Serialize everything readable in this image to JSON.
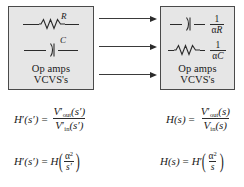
{
  "diagram": {
    "left_box": {
      "name": "original-network",
      "rows": [
        {
          "symbol": "resistor-icon",
          "label": "R"
        },
        {
          "symbol": "capacitor-icon",
          "label": "C"
        }
      ],
      "caption_line1": "Op amps",
      "caption_line2": "VCVS's"
    },
    "right_box": {
      "name": "transformed-network",
      "rows": [
        {
          "symbol": "capacitor-icon",
          "numerator": "1",
          "denominator_alpha": "α",
          "denominator_var": "R"
        },
        {
          "symbol": "resistor-icon",
          "numerator": "1",
          "denominator_alpha": "α",
          "denominator_var": "C"
        }
      ],
      "caption_line1": "Op amps",
      "caption_line2": "VCVS's"
    },
    "arrows": [
      {
        "name": "arrow-row-1",
        "direction": "right"
      },
      {
        "name": "arrow-row-2",
        "direction": "right"
      },
      {
        "name": "arrow-row-3",
        "direction": "right"
      }
    ],
    "equations": {
      "left_1": {
        "lhs_fn": "H",
        "lhs_prime": "′",
        "lhs_arg": "(s′)",
        "eq": "=",
        "num_fn": "V",
        "num_prime": "′",
        "num_sub": "out",
        "num_arg": "(s′)",
        "den_fn": "V",
        "den_prime": "′",
        "den_sub": "in",
        "den_arg": "(s′)"
      },
      "right_1": {
        "lhs_fn": "H",
        "lhs_arg": "(s)",
        "eq": "=",
        "num_fn": "V",
        "num_prime": "′",
        "num_sub": "out",
        "num_arg": "(s)",
        "den_fn": "V",
        "den_sub": "in",
        "den_arg": "(s)"
      },
      "left_2": {
        "lhs_fn": "H",
        "lhs_prime": "′",
        "lhs_arg": "(s′)",
        "eq": "=",
        "rhs_fn": "H",
        "num_alpha": "α",
        "num_exp": "2",
        "den_var": "s′"
      },
      "right_2": {
        "lhs_fn": "H",
        "lhs_arg": "(s)",
        "eq": "=",
        "rhs_fn": "H",
        "rhs_prime": "′",
        "num_alpha": "α",
        "num_exp": "2",
        "den_var": "s"
      }
    },
    "colors": {
      "box_fill": "#e6e6e6",
      "box_border": "#4a4a4a",
      "ink": "#1a1a1a",
      "page_background": "#ffffff"
    }
  }
}
